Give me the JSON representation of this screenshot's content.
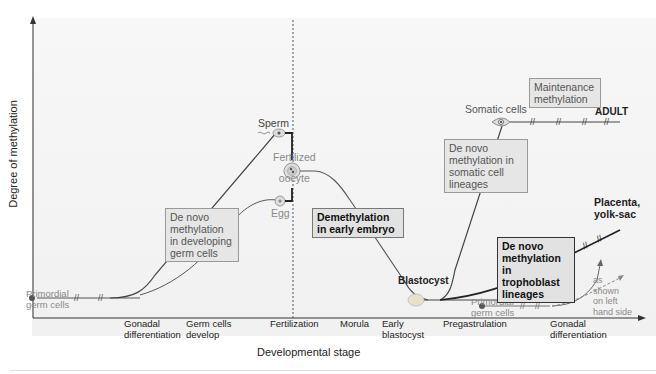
{
  "diagram": {
    "y_axis_label": "Degree of methylation",
    "x_axis_label": "Developmental stage",
    "x_ticks": [
      {
        "label": "Gonadal differentiation",
        "line1": "Gonadal",
        "line2": "differentiation"
      },
      {
        "label": "Germ cells develop",
        "line1": "Germ cells",
        "line2": "develop"
      },
      {
        "label": "Fertilization",
        "line1": "Fertilization",
        "line2": ""
      },
      {
        "label": "Morula",
        "line1": "Morula",
        "line2": ""
      },
      {
        "label": "Early blastocyst",
        "line1": "Early",
        "line2": "blastocyst"
      },
      {
        "label": "Pregastrulation",
        "line1": "Pregastrulation",
        "line2": ""
      },
      {
        "label": "Gonadal differentiation",
        "line1": "Gonadal",
        "line2": "differentiation"
      }
    ],
    "nodes": {
      "primordial_left": {
        "line1": "Primordial",
        "line2": "germ cells"
      },
      "sperm": "Sperm",
      "egg": "Egg",
      "fertilized_oocyte": {
        "line1": "Fertilized",
        "line2": "oocyte"
      },
      "blastocyst": "Blastocyst",
      "somatic_cells": "Somatic cells",
      "adult": "ADULT",
      "placenta": {
        "line1": "Placenta,",
        "line2": "yolk-sac"
      },
      "primordial_right": {
        "line1": "Primordial",
        "line2": "germ cells"
      },
      "as_shown": {
        "line1": "as",
        "line2": "shown",
        "line3": "on left",
        "line4": "hand side"
      }
    },
    "boxes": {
      "de_novo_germ": [
        "De novo",
        "methylation",
        "in developing",
        "germ cells"
      ],
      "demethylation": [
        "Demethylation",
        "in early embryo"
      ],
      "de_novo_somatic": [
        "De novo",
        "methylation in",
        "somatic cell",
        "lineages"
      ],
      "maintenance": [
        "Maintenance",
        "methylation"
      ],
      "de_novo_trophoblast": [
        "De novo",
        "methylation in",
        "trophoblast",
        "lineages"
      ]
    },
    "colors": {
      "line": "#444444",
      "box_fill": "#e6e6e6",
      "box_border": "#999999",
      "gray_text": "#8a8a8a",
      "dark_text": "#111111"
    }
  }
}
